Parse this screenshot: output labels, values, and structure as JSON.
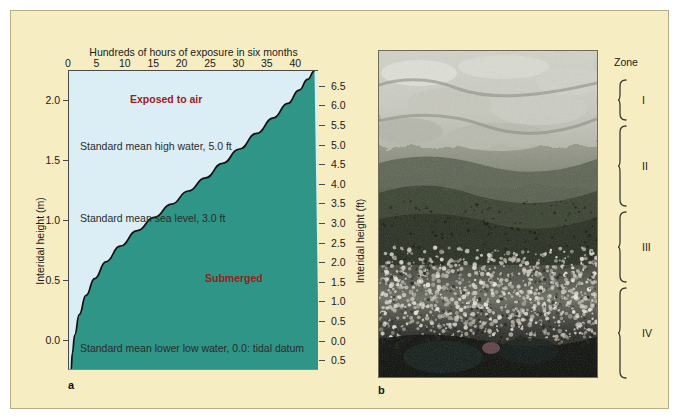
{
  "figure": {
    "panel_a_letter": "a",
    "panel_b_letter": "b",
    "background_color": "#F7EDC3",
    "exposed_color": "#DCEEF5",
    "submerged_color": "#2E9587",
    "label_color": "#9B2020"
  },
  "chart_data": {
    "type": "area",
    "title": "Hundreds of hours of exposure in six months",
    "xlabel": "Hundreds of hours of exposure in six months",
    "ylabel": "Interidal height (m)",
    "ylabel_right": "Interidal height (ft)",
    "xlim": [
      0,
      44
    ],
    "ylim_m": [
      -0.25,
      2.25
    ],
    "ylim_ft": [
      -0.75,
      6.9
    ],
    "grid": false,
    "xticks": [
      0,
      5,
      10,
      15,
      20,
      25,
      30,
      35,
      40
    ],
    "xticklabels": [
      "0",
      "5",
      "10",
      "15",
      "20",
      "25",
      "30",
      "35",
      "40"
    ],
    "yticks_left": [
      0.0,
      0.5,
      1.0,
      1.5,
      2.0
    ],
    "yticklabels_left": [
      "0.0",
      "0.5",
      "1.0",
      "1.5",
      "2.0"
    ],
    "yticks_right": [
      -0.5,
      0.0,
      0.5,
      1.0,
      1.5,
      2.0,
      2.5,
      3.0,
      3.5,
      4.0,
      4.5,
      5.0,
      5.5,
      6.0,
      6.5
    ],
    "yticklabels_right": [
      "0.5",
      "0.0",
      "0.5",
      "1.0",
      "1.5",
      "2.0",
      "2.5",
      "3.0",
      "3.5",
      "4.0",
      "4.5",
      "5.0",
      "5.5",
      "6.0",
      "6.5"
    ],
    "curve_points_xy": [
      [
        0.35,
        -0.25
      ],
      [
        0.6,
        -0.1
      ],
      [
        1.0,
        0.05
      ],
      [
        1.8,
        0.22
      ],
      [
        3.0,
        0.38
      ],
      [
        4.5,
        0.52
      ],
      [
        6.5,
        0.66
      ],
      [
        9.0,
        0.79
      ],
      [
        12.0,
        0.92
      ],
      [
        15.0,
        1.03
      ],
      [
        18.0,
        1.14
      ],
      [
        21.0,
        1.25
      ],
      [
        24.0,
        1.36
      ],
      [
        27.0,
        1.48
      ],
      [
        30.0,
        1.6
      ],
      [
        33.0,
        1.73
      ],
      [
        36.0,
        1.86
      ],
      [
        38.5,
        1.98
      ],
      [
        40.5,
        2.09
      ],
      [
        42.0,
        2.18
      ],
      [
        43.2,
        2.25
      ]
    ],
    "regions": [
      {
        "name": "Exposed to air",
        "label": "Exposed to air",
        "color": "#DCEEF5",
        "side": "above-left"
      },
      {
        "name": "Submerged",
        "label": "Submerged",
        "color": "#2E9587",
        "side": "below-right"
      }
    ],
    "annotations": [
      {
        "text": "Standard mean high water, 5.0 ft",
        "height_m": 1.5,
        "height_ft": 5.0
      },
      {
        "text": "Standard mean sea level, 3.0 ft",
        "height_m": 0.9,
        "height_ft": 3.0
      },
      {
        "text": "Standard mean lower low water, 0.0: tidal datum",
        "height_m": 0.0,
        "height_ft": 0.0
      }
    ]
  },
  "zones": {
    "title": "Zone",
    "items": [
      {
        "roman": "I"
      },
      {
        "roman": "II"
      },
      {
        "roman": "III"
      },
      {
        "roman": "IV"
      }
    ]
  }
}
